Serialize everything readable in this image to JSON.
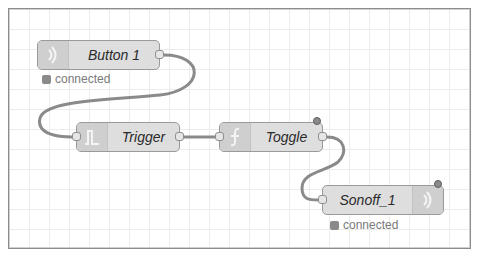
{
  "canvas": {
    "background": "#ffffff",
    "grid_color": "#ececec",
    "node_fill": "#dedede",
    "node_icon_fill": "#cfcfcf",
    "wire_color": "#8a8a8a"
  },
  "nodes": [
    {
      "id": "button1",
      "label": "Button 1",
      "icon": "wifi-signal-icon",
      "icon_side": "left",
      "inputs": 0,
      "outputs": 1,
      "status": {
        "text": "connected",
        "shape": "square"
      },
      "changed": false
    },
    {
      "id": "trigger",
      "label": "Trigger",
      "icon": "trigger-pulse-icon",
      "icon_side": "left",
      "inputs": 1,
      "outputs": 1,
      "changed": false
    },
    {
      "id": "toggle",
      "label": "Toggle",
      "icon": "function-icon",
      "icon_side": "left",
      "inputs": 1,
      "outputs": 1,
      "changed": true
    },
    {
      "id": "sonoff1",
      "label": "Sonoff_1",
      "icon": "wifi-signal-icon",
      "icon_side": "right",
      "inputs": 1,
      "outputs": 0,
      "status": {
        "text": "connected",
        "shape": "square"
      },
      "changed": true
    }
  ],
  "wires": [
    {
      "from": "button1",
      "to": "trigger"
    },
    {
      "from": "trigger",
      "to": "toggle"
    },
    {
      "from": "toggle",
      "to": "sonoff1"
    }
  ]
}
